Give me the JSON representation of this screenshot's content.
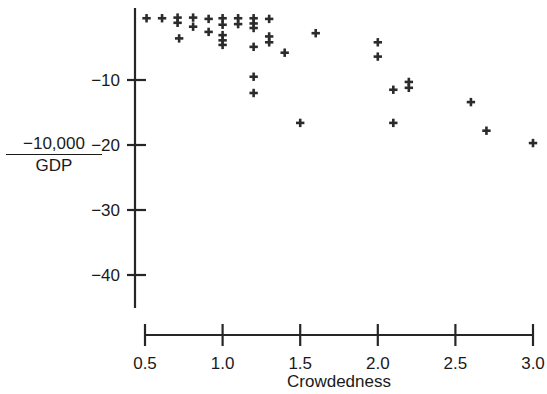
{
  "chart_data": {
    "type": "scatter",
    "title": "",
    "xlabel": "Crowdedness",
    "ylabel_numerator": "−10,000",
    "ylabel_denominator": "GDP",
    "ylabel_plain": "−10,000 / GDP",
    "xlim": [
      0.5,
      3.0
    ],
    "ylim": [
      -44,
      0
    ],
    "grid": false,
    "legend": null,
    "marker": "plus",
    "marker_color": "#2b2b2b",
    "xticks": [
      0.5,
      1.0,
      1.5,
      2.0,
      2.5,
      3.0
    ],
    "xtick_labels": [
      "0.5",
      "1.0",
      "1.5",
      "2.0",
      "2.5",
      "3.0"
    ],
    "yticks": [
      -10,
      -20,
      -30,
      -40
    ],
    "ytick_labels": [
      "−10",
      "−20",
      "−30",
      "−40"
    ],
    "points": [
      {
        "x": 0.51,
        "y": -0.5
      },
      {
        "x": 0.61,
        "y": -0.5
      },
      {
        "x": 0.71,
        "y": -0.4
      },
      {
        "x": 0.71,
        "y": -1.2
      },
      {
        "x": 0.72,
        "y": -3.6
      },
      {
        "x": 0.81,
        "y": -0.4
      },
      {
        "x": 0.81,
        "y": -1.8
      },
      {
        "x": 0.91,
        "y": -0.6
      },
      {
        "x": 0.91,
        "y": -2.6
      },
      {
        "x": 1.0,
        "y": -0.5
      },
      {
        "x": 1.0,
        "y": -1.5
      },
      {
        "x": 1.0,
        "y": -3.1
      },
      {
        "x": 1.0,
        "y": -3.9
      },
      {
        "x": 1.0,
        "y": -4.6
      },
      {
        "x": 1.1,
        "y": -0.5
      },
      {
        "x": 1.1,
        "y": -1.4
      },
      {
        "x": 1.2,
        "y": -0.5
      },
      {
        "x": 1.2,
        "y": -1.3
      },
      {
        "x": 1.2,
        "y": -2.0
      },
      {
        "x": 1.2,
        "y": -4.9
      },
      {
        "x": 1.2,
        "y": -9.5
      },
      {
        "x": 1.2,
        "y": -12.0
      },
      {
        "x": 1.3,
        "y": -0.6
      },
      {
        "x": 1.3,
        "y": -3.3
      },
      {
        "x": 1.3,
        "y": -4.2
      },
      {
        "x": 1.4,
        "y": -5.8
      },
      {
        "x": 1.5,
        "y": -16.6
      },
      {
        "x": 1.6,
        "y": -2.8
      },
      {
        "x": 2.0,
        "y": -4.2
      },
      {
        "x": 2.0,
        "y": -6.4
      },
      {
        "x": 2.1,
        "y": -11.5
      },
      {
        "x": 2.1,
        "y": -16.6
      },
      {
        "x": 2.2,
        "y": -10.3
      },
      {
        "x": 2.2,
        "y": -11.2
      },
      {
        "x": 2.6,
        "y": -13.4
      },
      {
        "x": 2.7,
        "y": -17.8
      },
      {
        "x": 3.0,
        "y": -19.7
      }
    ]
  }
}
